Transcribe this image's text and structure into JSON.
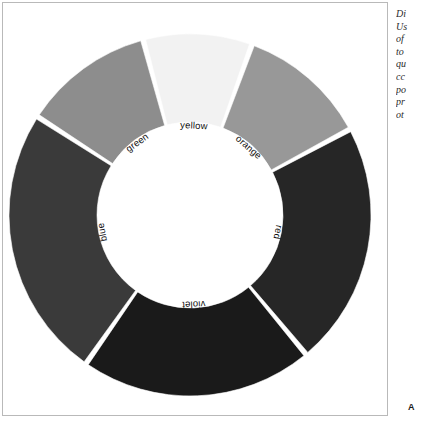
{
  "figure": {
    "panel_letter": "A",
    "background_color": "#ffffff",
    "frame_color": "#b9b9b9"
  },
  "caption": {
    "lines": [
      "Di",
      "Us",
      "of",
      "to",
      "qu",
      "cc",
      "po",
      "pr",
      "ot"
    ]
  },
  "chart_data": {
    "type": "pie",
    "variant": "donut",
    "title": "",
    "xlabel": "",
    "ylabel": "",
    "legend_position": "none",
    "grid": false,
    "labels_placement": "inner-edge-rotated",
    "center_x": 187,
    "center_y": 212,
    "outer_radius": 181,
    "inner_radius": 93,
    "start_angle_deg": -15,
    "direction": "clockwise",
    "gap_deg": 1.6,
    "categories": [
      "yellow",
      "orange",
      "red",
      "violet",
      "blue",
      "green"
    ],
    "values": [
      9.8,
      11.6,
      21.8,
      20.8,
      24.4,
      11.6
    ],
    "units": "percent",
    "slices": [
      {
        "label": "yellow",
        "value": 9.8,
        "color": "#f2f2f2",
        "start_deg": -15.0,
        "end_deg": 20.0
      },
      {
        "label": "orange",
        "value": 11.6,
        "color": "#989898",
        "start_deg": 20.0,
        "end_deg": 61.8
      },
      {
        "label": "red",
        "value": 21.8,
        "color": "#262626",
        "start_deg": 61.8,
        "end_deg": 140.2
      },
      {
        "label": "violet",
        "value": 20.8,
        "color": "#1a1a1a",
        "start_deg": 140.2,
        "end_deg": 215.0
      },
      {
        "label": "blue",
        "value": 24.4,
        "color": "#3a3a3a",
        "start_deg": 215.0,
        "end_deg": 302.8
      },
      {
        "label": "green",
        "value": 11.6,
        "color": "#8d8d8d",
        "start_deg": 302.8,
        "end_deg": 345.0
      }
    ]
  }
}
